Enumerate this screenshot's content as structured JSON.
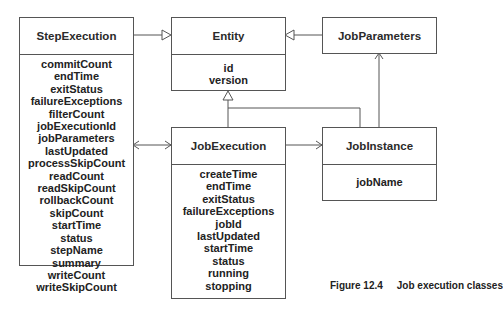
{
  "caption": {
    "figure_label": "Figure 12.4",
    "title": "Job execution classes"
  },
  "classes": {
    "step_execution": {
      "name": "StepExecution",
      "attributes": [
        "commitCount",
        "endTime",
        "exitStatus",
        "failureExceptions",
        "filterCount",
        "jobExecutionId",
        "jobParameters",
        "lastUpdated",
        "processSkipCount",
        "readCount",
        "readSkipCount",
        "rollbackCount",
        "skipCount",
        "startTime",
        "status",
        "stepName",
        "summary",
        "writeCount",
        "writeSkipCount"
      ]
    },
    "entity": {
      "name": "Entity",
      "attributes": [
        "id",
        "version"
      ]
    },
    "job_parameters": {
      "name": "JobParameters",
      "attributes": []
    },
    "job_execution": {
      "name": "JobExecution",
      "attributes": [
        "createTime",
        "endTime",
        "exitStatus",
        "failureExceptions",
        "jobId",
        "lastUpdated",
        "startTime",
        "status",
        "running",
        "stopping"
      ]
    },
    "job_instance": {
      "name": "JobInstance",
      "attributes": [
        "jobName"
      ]
    }
  },
  "relationships": [
    {
      "from": "StepExecution",
      "to": "Entity",
      "type": "generalization"
    },
    {
      "from": "JobParameters",
      "to": "Entity",
      "type": "generalization"
    },
    {
      "from": "JobExecution",
      "to": "Entity",
      "type": "generalization"
    },
    {
      "from": "JobInstance",
      "to": "Entity",
      "type": "generalization"
    },
    {
      "from": "StepExecution",
      "to": "JobExecution",
      "type": "bidirectional-association"
    },
    {
      "from": "JobExecution",
      "to": "JobInstance",
      "type": "association"
    },
    {
      "from": "JobInstance",
      "to": "JobParameters",
      "type": "association"
    }
  ]
}
